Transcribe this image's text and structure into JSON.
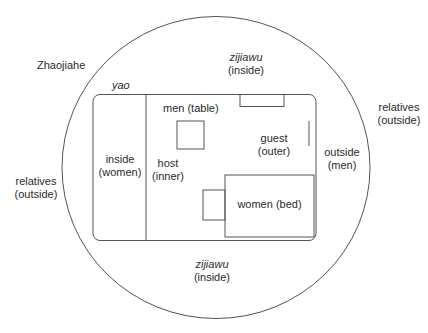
{
  "diagram": {
    "place": "Zhaojiahe",
    "yao": "yao",
    "top_zone": {
      "line1": "zijiawu",
      "line2": "(inside)"
    },
    "bottom_zone": {
      "line1": "zijiawu",
      "line2": "(inside)"
    },
    "right_outer": {
      "line1": "relatives",
      "line2": "(outside)"
    },
    "left_outer": {
      "line1": "relatives",
      "line2": "(outside)"
    },
    "inside_women": {
      "line1": "inside",
      "line2": "(women)"
    },
    "host": {
      "line1": "host",
      "line2": "(inner)"
    },
    "guest": {
      "line1": "guest",
      "line2": "(outer)"
    },
    "outside_men": {
      "line1": "outside",
      "line2": "(men)"
    },
    "men_table": "men (table)",
    "women_bed": "women (bed)",
    "line_color": "#555555"
  }
}
